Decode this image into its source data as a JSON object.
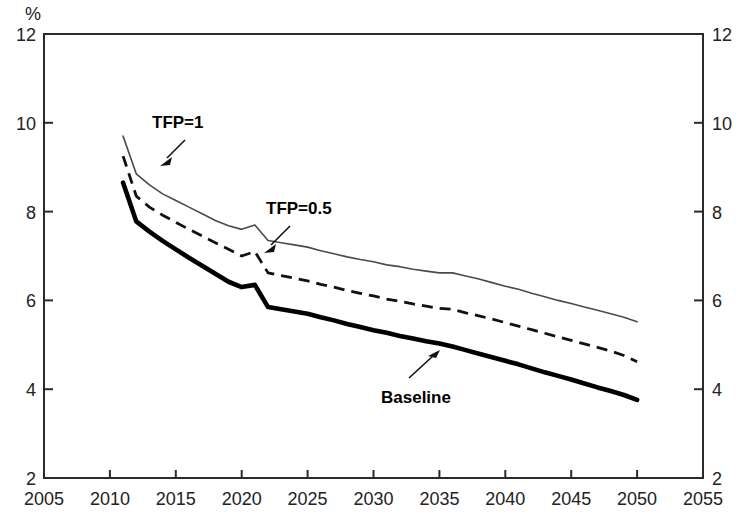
{
  "chart_data": {
    "type": "line",
    "title": "",
    "subtitle": "",
    "xlabel": "",
    "ylabel": "%",
    "unit_label": "%",
    "xlim": [
      2005,
      2055
    ],
    "ylim": [
      2,
      12
    ],
    "xticks": [
      2005,
      2010,
      2015,
      2020,
      2025,
      2030,
      2035,
      2040,
      2045,
      2050,
      2055
    ],
    "yticks": [
      2,
      4,
      6,
      8,
      10,
      12
    ],
    "xtick_labels": [
      "2005",
      "2010",
      "2015",
      "2020",
      "2025",
      "2030",
      "2035",
      "2040",
      "2045",
      "2050",
      "2055"
    ],
    "ytick_labels_left": [
      "2",
      "4",
      "6",
      "8",
      "10",
      "12"
    ],
    "ytick_labels_right": [
      "2",
      "4",
      "6",
      "8",
      "10",
      "12"
    ],
    "grid": false,
    "legend": "inline-annotations",
    "legend_position": "inline",
    "x": [
      2011,
      2012,
      2013,
      2014,
      2015,
      2016,
      2017,
      2018,
      2019,
      2020,
      2021,
      2022,
      2023,
      2024,
      2025,
      2026,
      2027,
      2028,
      2029,
      2030,
      2031,
      2032,
      2033,
      2034,
      2035,
      2036,
      2037,
      2038,
      2039,
      2040,
      2041,
      2042,
      2043,
      2044,
      2045,
      2046,
      2047,
      2048,
      2049,
      2050
    ],
    "series": [
      {
        "name": "TFP=1",
        "style": "thin-solid",
        "color": "#4a4a4a",
        "values": [
          9.7,
          8.85,
          8.6,
          8.4,
          8.25,
          8.1,
          7.95,
          7.8,
          7.68,
          7.6,
          7.7,
          7.35,
          7.3,
          7.25,
          7.2,
          7.12,
          7.05,
          6.98,
          6.92,
          6.87,
          6.8,
          6.76,
          6.7,
          6.66,
          6.62,
          6.62,
          6.55,
          6.48,
          6.4,
          6.32,
          6.25,
          6.16,
          6.08,
          6.0,
          5.93,
          5.85,
          5.78,
          5.7,
          5.62,
          5.52
        ]
      },
      {
        "name": "TFP=0.5",
        "style": "dashed",
        "color": "#111111",
        "values": [
          9.25,
          8.35,
          8.1,
          7.92,
          7.76,
          7.6,
          7.45,
          7.3,
          7.15,
          7.0,
          7.1,
          6.62,
          6.56,
          6.5,
          6.44,
          6.36,
          6.3,
          6.22,
          6.16,
          6.1,
          6.03,
          5.98,
          5.92,
          5.87,
          5.82,
          5.8,
          5.72,
          5.65,
          5.58,
          5.5,
          5.42,
          5.34,
          5.26,
          5.18,
          5.1,
          5.02,
          4.94,
          4.86,
          4.76,
          4.62
        ]
      },
      {
        "name": "Baseline",
        "style": "thick-solid",
        "color": "#000000",
        "values": [
          8.65,
          7.78,
          7.55,
          7.34,
          7.15,
          6.96,
          6.78,
          6.6,
          6.42,
          6.3,
          6.35,
          5.85,
          5.8,
          5.75,
          5.7,
          5.62,
          5.55,
          5.47,
          5.4,
          5.33,
          5.27,
          5.2,
          5.14,
          5.08,
          5.03,
          4.96,
          4.88,
          4.8,
          4.72,
          4.64,
          4.56,
          4.47,
          4.38,
          4.3,
          4.22,
          4.13,
          4.04,
          3.96,
          3.87,
          3.76
        ]
      }
    ],
    "annotations": [
      {
        "label": "TFP=1",
        "x": 152,
        "y": 128,
        "arrow_from": [
          185,
          140
        ],
        "arrow_to": [
          163,
          162
        ]
      },
      {
        "label": "TFP=0.5",
        "x": 266,
        "y": 214,
        "arrow_from": [
          290,
          226
        ],
        "arrow_to": [
          266,
          249
        ]
      },
      {
        "label": "Baseline",
        "x": 381,
        "y": 403,
        "arrow_from": [
          409,
          378
        ],
        "arrow_to": [
          438,
          352
        ]
      }
    ]
  }
}
